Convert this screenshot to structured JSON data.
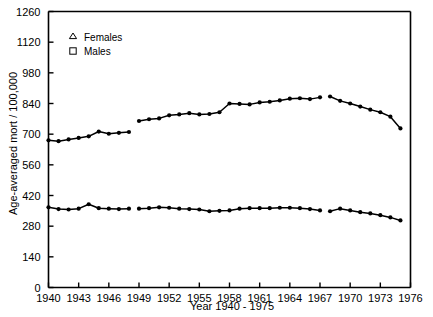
{
  "chart_data": {
    "type": "line",
    "title": "",
    "xlabel": "Year 1940 - 1975",
    "ylabel": "Age-averaged mort / 100,000",
    "xlim": [
      1940,
      1976
    ],
    "ylim": [
      0,
      1260
    ],
    "grid": false,
    "legend_position": "top-left",
    "x_ticks": [
      "1940",
      "1943",
      "1946",
      "1949",
      "1952",
      "1955",
      "1958",
      "1961",
      "1964",
      "1967",
      "1970",
      "1973",
      "1976"
    ],
    "x_tick_values": [
      1940,
      1943,
      1946,
      1949,
      1952,
      1955,
      1958,
      1961,
      1964,
      1967,
      1970,
      1973,
      1976
    ],
    "y_ticks": [
      "0",
      "140",
      "280",
      "420",
      "560",
      "700",
      "840",
      "980",
      "1120",
      "1260"
    ],
    "y_tick_values": [
      0,
      140,
      280,
      420,
      560,
      700,
      840,
      980,
      1120,
      1260
    ],
    "x": [
      1940,
      1941,
      1942,
      1943,
      1944,
      1945,
      1946,
      1947,
      1948,
      1949,
      1950,
      1951,
      1952,
      1953,
      1954,
      1955,
      1956,
      1957,
      1958,
      1959,
      1960,
      1961,
      1962,
      1963,
      1964,
      1965,
      1966,
      1967,
      1968,
      1969,
      1970,
      1971,
      1972,
      1973,
      1974,
      1975
    ],
    "series": [
      {
        "name": "Males",
        "marker": "square",
        "line_breaks_after": [
          1948,
          1967
        ],
        "values": [
          672,
          668,
          676,
          683,
          690,
          712,
          702,
          706,
          710,
          760,
          768,
          772,
          786,
          790,
          796,
          790,
          792,
          800,
          840,
          838,
          836,
          845,
          848,
          854,
          862,
          864,
          860,
          868,
          872,
          852,
          840,
          826,
          812,
          800,
          780,
          726
        ]
      },
      {
        "name": "Females",
        "marker": "triangle",
        "line_breaks_after": [
          1948,
          1967
        ],
        "values": [
          366,
          358,
          356,
          360,
          380,
          362,
          360,
          358,
          360,
          360,
          362,
          366,
          364,
          360,
          358,
          356,
          348,
          350,
          352,
          360,
          362,
          362,
          362,
          364,
          364,
          362,
          358,
          352,
          348,
          360,
          352,
          344,
          338,
          330,
          320,
          306
        ]
      }
    ],
    "legend": [
      {
        "label": "Females",
        "marker": "triangle"
      },
      {
        "label": "Males",
        "marker": "square"
      }
    ]
  }
}
